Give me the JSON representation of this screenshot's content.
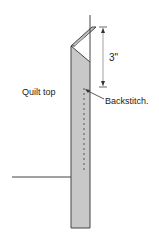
{
  "diagram": {
    "labels": {
      "quilt_top": "Quilt top",
      "backstitch": "Backstitch.",
      "dimension": "3\""
    },
    "colors": {
      "binding_fill": "#c8c8c8",
      "outline": "#444444",
      "stitch": "#555555"
    }
  }
}
